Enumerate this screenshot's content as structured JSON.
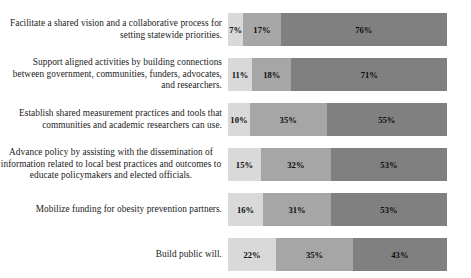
{
  "chart_data": {
    "type": "bar",
    "orientation": "horizontal",
    "stacked": true,
    "normalized_percent": true,
    "title": "",
    "subtitle": "",
    "xlabel": "",
    "ylabel": "",
    "xlim": [
      0,
      100
    ],
    "grid": false,
    "legend": "none",
    "value_suffix": "%",
    "categories": [
      "Facilitate a shared vision and a collaborative process for setting statewide priorities.",
      "Support aligned activities by building connections between government, communities, funders, advocates, and researchers.",
      "Establish shared measurement practices and tools that communities and academic researchers can use.",
      "Advance policy by assisting with the dissemination of information related to local best practices and outcomes to educate policymakers and elected officials.",
      "Mobilize funding for obesity prevention partners.",
      "Build public will."
    ],
    "series": [
      {
        "name": "segment-1",
        "color": "#d9d9d9",
        "values": [
          7,
          11,
          10,
          15,
          16,
          22
        ]
      },
      {
        "name": "segment-2",
        "color": "#a6a6a6",
        "values": [
          17,
          18,
          35,
          32,
          31,
          35
        ]
      },
      {
        "name": "segment-3",
        "color": "#808080",
        "values": [
          76,
          71,
          55,
          53,
          53,
          43
        ]
      }
    ],
    "rows": [
      {
        "label": "Facilitate a shared vision and a collaborative process for setting statewide priorities.",
        "label_align": "right",
        "segments": [
          {
            "value": 7,
            "label": "7%",
            "color": "#d9d9d9"
          },
          {
            "value": 17,
            "label": "17%",
            "color": "#a6a6a6"
          },
          {
            "value": 76,
            "label": "76%",
            "color": "#808080"
          }
        ]
      },
      {
        "label": "Support aligned activities by building connections between government, communities, funders, advocates, and researchers.",
        "label_align": "right",
        "segments": [
          {
            "value": 11,
            "label": "11%",
            "color": "#d9d9d9"
          },
          {
            "value": 18,
            "label": "18%",
            "color": "#a6a6a6"
          },
          {
            "value": 71,
            "label": "71%",
            "color": "#808080"
          }
        ]
      },
      {
        "label": "Establish shared measurement practices and tools that communities and academic researchers can use.",
        "label_align": "right",
        "segments": [
          {
            "value": 10,
            "label": "10%",
            "color": "#d9d9d9"
          },
          {
            "value": 35,
            "label": "35%",
            "color": "#a6a6a6"
          },
          {
            "value": 55,
            "label": "55%",
            "color": "#808080"
          }
        ]
      },
      {
        "label": "Advance policy by assisting with the dissemination of information related to local best practices and outcomes to educate policymakers and elected officials.",
        "label_align": "center",
        "segments": [
          {
            "value": 15,
            "label": "15%",
            "color": "#d9d9d9"
          },
          {
            "value": 32,
            "label": "32%",
            "color": "#a6a6a6"
          },
          {
            "value": 53,
            "label": "53%",
            "color": "#808080"
          }
        ]
      },
      {
        "label": "Mobilize funding for obesity prevention partners.",
        "label_align": "right",
        "segments": [
          {
            "value": 16,
            "label": "16%",
            "color": "#d9d9d9"
          },
          {
            "value": 31,
            "label": "31%",
            "color": "#a6a6a6"
          },
          {
            "value": 53,
            "label": "53%",
            "color": "#808080"
          }
        ]
      },
      {
        "label": "Build public will.",
        "label_align": "right",
        "segments": [
          {
            "value": 22,
            "label": "22%",
            "color": "#d9d9d9"
          },
          {
            "value": 35,
            "label": "35%",
            "color": "#a6a6a6"
          },
          {
            "value": 43,
            "label": "43%",
            "color": "#808080"
          }
        ]
      }
    ]
  },
  "layout": {
    "row_tops": [
      13,
      58,
      103,
      148,
      193,
      238
    ],
    "bar_left": 236,
    "bar_width": 219,
    "bar_height": 33,
    "label_width": 228
  }
}
